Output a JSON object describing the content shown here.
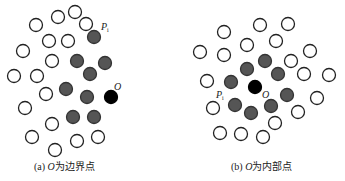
{
  "panels": [
    {
      "id": "a",
      "caption_prefix": "(a) ",
      "caption_var": "O",
      "caption_suffix": "为边界点",
      "open_points": [
        [
          36,
          25
        ],
        [
          58,
          17
        ],
        [
          75,
          12
        ],
        [
          86,
          24
        ],
        [
          49,
          41
        ],
        [
          68,
          41
        ],
        [
          23,
          51
        ],
        [
          52,
          61
        ],
        [
          14,
          76
        ],
        [
          37,
          76
        ],
        [
          46,
          94
        ],
        [
          25,
          108
        ],
        [
          52,
          124
        ],
        [
          32,
          137
        ],
        [
          77,
          141
        ],
        [
          98,
          137
        ],
        [
          55,
          150
        ]
      ],
      "neighbor_points": [
        [
          94,
          37
        ],
        [
          77,
          61
        ],
        [
          105,
          63
        ],
        [
          90,
          74
        ],
        [
          66,
          89
        ],
        [
          87,
          97
        ],
        [
          73,
          117
        ],
        [
          94,
          117
        ]
      ],
      "center_point": [
        111,
        97
      ],
      "label_O": {
        "text": "O",
        "pos": [
          114,
          90
        ]
      },
      "label_P": {
        "text": "P",
        "sub": "i",
        "pos": [
          101,
          30
        ]
      }
    },
    {
      "id": "b",
      "caption_prefix": "(b) ",
      "caption_var": "O",
      "caption_suffix": "为内部点",
      "open_points": [
        [
          224,
          32
        ],
        [
          260,
          25
        ],
        [
          288,
          24
        ],
        [
          247,
          45
        ],
        [
          276,
          41
        ],
        [
          200,
          52
        ],
        [
          224,
          55
        ],
        [
          310,
          51
        ],
        [
          291,
          61
        ],
        [
          207,
          81
        ],
        [
          304,
          74
        ],
        [
          329,
          75
        ],
        [
          317,
          98
        ],
        [
          213,
          108
        ],
        [
          298,
          112
        ],
        [
          275,
          123
        ],
        [
          220,
          133
        ],
        [
          241,
          134
        ],
        [
          263,
          137
        ]
      ],
      "neighbor_points": [
        [
          265,
          61
        ],
        [
          247,
          69
        ],
        [
          278,
          74
        ],
        [
          231,
          82
        ],
        [
          287,
          95
        ],
        [
          235,
          105
        ],
        [
          271,
          106
        ],
        [
          251,
          113
        ]
      ],
      "center_point": [
        255,
        87
      ],
      "label_O": {
        "text": "O",
        "pos": [
          262,
          98
        ]
      },
      "label_P": {
        "text": "P",
        "sub": "i",
        "pos": [
          216,
          98
        ]
      }
    }
  ],
  "colors": {
    "open_stroke": "#222222",
    "neighbor_fill": "#555555",
    "center_fill": "#000000"
  },
  "radius": 6.5
}
